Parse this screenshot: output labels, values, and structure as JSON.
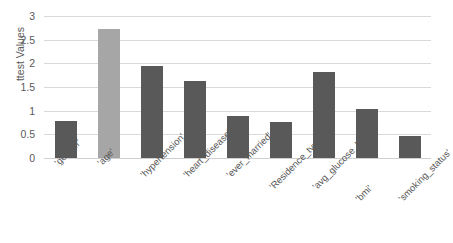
{
  "chart_data": {
    "type": "bar",
    "title": "",
    "xlabel": "",
    "ylabel": "ttest Values",
    "ylim": [
      0,
      3
    ],
    "ytick_labels": [
      "3",
      "2.5",
      "2",
      "1.5",
      "1",
      "0.5",
      "0"
    ],
    "yticks": [
      3,
      2.5,
      2,
      1.5,
      1,
      0.5,
      0
    ],
    "grid": true,
    "legend": "none",
    "categories": [
      "'gender'",
      "'age'",
      "'hypertension'",
      "'heart_disease'",
      "'ever_married'",
      "'Residence_type'",
      "'avg_glucose_level'",
      "'bmi'",
      "'smoking_status'"
    ],
    "values": [
      0.79,
      2.73,
      1.94,
      1.62,
      0.88,
      0.77,
      1.81,
      1.03,
      0.46
    ],
    "bar_colors": [
      "#595959",
      "#a6a6a6",
      "#595959",
      "#595959",
      "#595959",
      "#595959",
      "#595959",
      "#595959",
      "#595959"
    ]
  },
  "style": {
    "background": "#ffffff",
    "gridline_color": "#d9d9d9",
    "text_color": "#595959",
    "bar_dark": "#595959",
    "bar_light": "#a6a6a6"
  }
}
